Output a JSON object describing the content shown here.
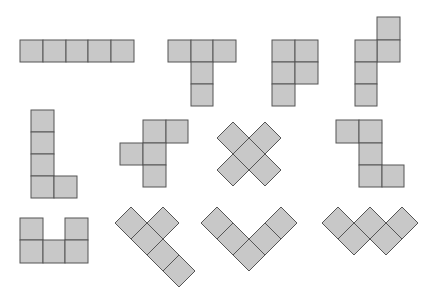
{
  "diagram": {
    "title": "",
    "colors": {
      "fill": "#c8c8c8",
      "stroke": "#555555",
      "background": "#ffffff"
    },
    "cell_size_px": 22.7,
    "shapes": [
      {
        "id": "I",
        "orientation": "axis-aligned"
      },
      {
        "id": "T",
        "orientation": "axis-aligned"
      },
      {
        "id": "P",
        "orientation": "axis-aligned"
      },
      {
        "id": "N",
        "orientation": "axis-aligned"
      },
      {
        "id": "L",
        "orientation": "axis-aligned"
      },
      {
        "id": "F",
        "orientation": "axis-aligned"
      },
      {
        "id": "X",
        "orientation": "rotated-45"
      },
      {
        "id": "Z",
        "orientation": "axis-aligned"
      },
      {
        "id": "U",
        "orientation": "axis-aligned"
      },
      {
        "id": "Y",
        "orientation": "rotated-45"
      },
      {
        "id": "V",
        "orientation": "rotated-45"
      },
      {
        "id": "W",
        "orientation": "rotated-45"
      }
    ]
  }
}
